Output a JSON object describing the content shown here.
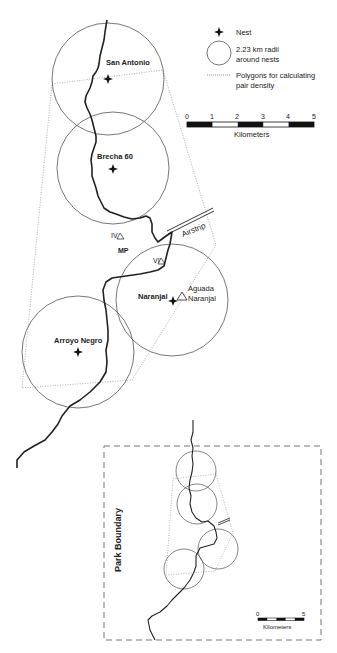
{
  "legend": {
    "nest_label": "Nest",
    "radius_label_line1": "2.23 km radii",
    "radius_label_line2": "around nests",
    "polygon_label_line1": "Polygons for calculating",
    "polygon_label_line2": "pair density"
  },
  "scale_main": {
    "ticks": [
      "0",
      "1",
      "2",
      "3",
      "4",
      "5"
    ],
    "unit": "Kilometers"
  },
  "nests": [
    {
      "name": "San Antonio"
    },
    {
      "name": "Brecha 60"
    },
    {
      "name": "Naranjal"
    },
    {
      "name": "Arroyo Negro"
    }
  ],
  "features": {
    "airstrip": "Airstrip",
    "site_iv": "IV",
    "site_vi": "VI",
    "mp": "MP",
    "aguada_line1": "Aguada",
    "aguada_line2": "Naranjal"
  },
  "inset": {
    "boundary_label": "Park Boundary",
    "scale_ticks": [
      "0",
      "5"
    ],
    "scale_unit": "Kilometers"
  },
  "colors": {
    "ink": "#222222",
    "circle": "#555555",
    "polygon": "#9a9a9a",
    "boundary": "#777777"
  }
}
